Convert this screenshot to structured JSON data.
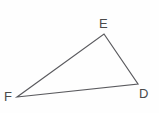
{
  "figure": {
    "kind": "geometry-diagram",
    "shape": "triangle",
    "background_color": "#fefefe",
    "stroke_color": "#5a5a5e",
    "stroke_width": 1.2,
    "label_color": "#4a4a4a",
    "width": 159,
    "height": 113,
    "vertices": [
      {
        "id": "E",
        "label": "E",
        "x": 104,
        "y": 34,
        "label_x": 99,
        "label_y": 17
      },
      {
        "id": "D",
        "label": "D",
        "x": 138,
        "y": 84,
        "label_x": 139,
        "label_y": 87
      },
      {
        "id": "F",
        "label": "F",
        "x": 17,
        "y": 97,
        "label_x": 4,
        "label_y": 90
      }
    ],
    "edges": [
      {
        "id": "FE",
        "from": "F",
        "to": "E"
      },
      {
        "id": "ED",
        "from": "E",
        "to": "D"
      },
      {
        "id": "DF",
        "from": "D",
        "to": "F"
      }
    ],
    "polygon_points": "17,97 104,34 138,84"
  }
}
